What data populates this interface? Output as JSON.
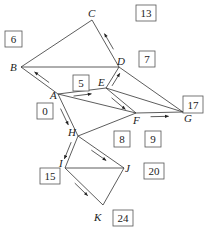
{
  "nodes": [
    {
      "id": "A",
      "x": 58,
      "y": 94,
      "lx": 50,
      "ly": 99
    },
    {
      "id": "B",
      "x": 21,
      "y": 67,
      "lx": 10,
      "ly": 71
    },
    {
      "id": "C",
      "x": 92,
      "y": 20,
      "lx": 88,
      "ly": 17
    },
    {
      "id": "D",
      "x": 119,
      "y": 67,
      "lx": 117,
      "ly": 65
    },
    {
      "id": "E",
      "x": 106,
      "y": 88,
      "lx": 98,
      "ly": 86
    },
    {
      "id": "F",
      "x": 136,
      "y": 113,
      "lx": 133,
      "ly": 124
    },
    {
      "id": "G",
      "x": 183,
      "y": 112,
      "lx": 184,
      "ly": 122
    },
    {
      "id": "H",
      "x": 78,
      "y": 136,
      "lx": 68,
      "ly": 136
    },
    {
      "id": "I",
      "x": 65,
      "y": 168,
      "lx": 59,
      "ly": 167
    },
    {
      "id": "J",
      "x": 124,
      "y": 168,
      "lx": 125,
      "ly": 172
    },
    {
      "id": "K",
      "x": 103,
      "y": 205,
      "lx": 94,
      "ly": 221
    }
  ],
  "edges": [
    [
      "B",
      "C"
    ],
    [
      "C",
      "D"
    ],
    [
      "B",
      "D"
    ],
    [
      "B",
      "A"
    ],
    [
      "A",
      "E"
    ],
    [
      "A",
      "F"
    ],
    [
      "E",
      "D"
    ],
    [
      "E",
      "F"
    ],
    [
      "E",
      "G"
    ],
    [
      "D",
      "G"
    ],
    [
      "F",
      "G"
    ],
    [
      "A",
      "H"
    ],
    [
      "H",
      "F"
    ],
    [
      "H",
      "I"
    ],
    [
      "H",
      "J"
    ],
    [
      "I",
      "J"
    ],
    [
      "I",
      "K"
    ],
    [
      "J",
      "K"
    ]
  ],
  "boxes": [
    {
      "label": "6",
      "x": 5,
      "y": 31,
      "w": 17,
      "h": 16
    },
    {
      "label": "13",
      "x": 136,
      "y": 5,
      "w": 20,
      "h": 16
    },
    {
      "label": "7",
      "x": 139,
      "y": 51,
      "w": 16,
      "h": 16
    },
    {
      "label": "5",
      "x": 73,
      "y": 75,
      "w": 16,
      "h": 16
    },
    {
      "label": "0",
      "x": 37,
      "y": 103,
      "w": 16,
      "h": 16
    },
    {
      "label": "17",
      "x": 183,
      "y": 96,
      "w": 20,
      "h": 17
    },
    {
      "label": "8",
      "x": 114,
      "y": 131,
      "w": 16,
      "h": 16
    },
    {
      "label": "9",
      "x": 145,
      "y": 131,
      "w": 16,
      "h": 16
    },
    {
      "label": "20",
      "x": 144,
      "y": 163,
      "w": 20,
      "h": 16
    },
    {
      "label": "15",
      "x": 40,
      "y": 168,
      "w": 20,
      "h": 16
    },
    {
      "label": "24",
      "x": 113,
      "y": 210,
      "w": 20,
      "h": 16
    }
  ],
  "arrows": [
    {
      "from": "D",
      "to": "C",
      "note": "arrow beside C-D pointing up to C"
    },
    {
      "from": "A",
      "to": "B",
      "note": "arrow beside A-B pointing to B"
    },
    {
      "from": "A",
      "to": "E",
      "note": "arrow beside A-E pointing to E"
    },
    {
      "from": "E",
      "to": "D",
      "note": "arrow beside E-D pointing to D"
    },
    {
      "from": "E",
      "to": "F",
      "note": "arrow beside E-F pointing to F"
    },
    {
      "from": "F",
      "to": "G",
      "note": "arrow below F-G pointing to G"
    },
    {
      "from": "A",
      "to": "H",
      "note": "arrow beside A-H pointing to H"
    },
    {
      "from": "H",
      "to": "I",
      "note": "arrow beside H-I pointing to I"
    },
    {
      "from": "H",
      "to": "J",
      "note": "arrow beside H-J pointing to J"
    },
    {
      "from": "I",
      "to": "K",
      "note": "arrow beside I-K pointing to K"
    }
  ]
}
